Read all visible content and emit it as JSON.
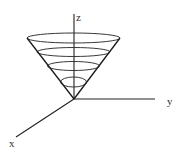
{
  "figure": {
    "axes": {
      "z": {
        "label": "z",
        "from": [
          74,
          99
        ],
        "to": [
          74,
          14
        ],
        "label_pos": [
          76,
          21
        ]
      },
      "y": {
        "label": "y",
        "from": [
          74,
          99
        ],
        "to": [
          155,
          99
        ],
        "label_pos": [
          167,
          105
        ]
      },
      "x": {
        "label": "x",
        "from": [
          74,
          99
        ],
        "to": [
          16,
          137
        ],
        "label_pos": [
          9,
          147
        ]
      }
    },
    "cone": {
      "apex": [
        74,
        99
      ],
      "left_rim": [
        27,
        38
      ],
      "right_rim": [
        120,
        38
      ]
    },
    "rings": [
      {
        "cx": 73.5,
        "cy": 38,
        "rx": 46.5,
        "ry": 5
      },
      {
        "cx": 73.5,
        "cy": 52,
        "rx": 36.5,
        "ry": 4.5
      },
      {
        "cx": 73.5,
        "cy": 66,
        "rx": 26,
        "ry": 4.5
      },
      {
        "cx": 73.5,
        "cy": 82,
        "rx": 13,
        "ry": 5
      }
    ]
  }
}
